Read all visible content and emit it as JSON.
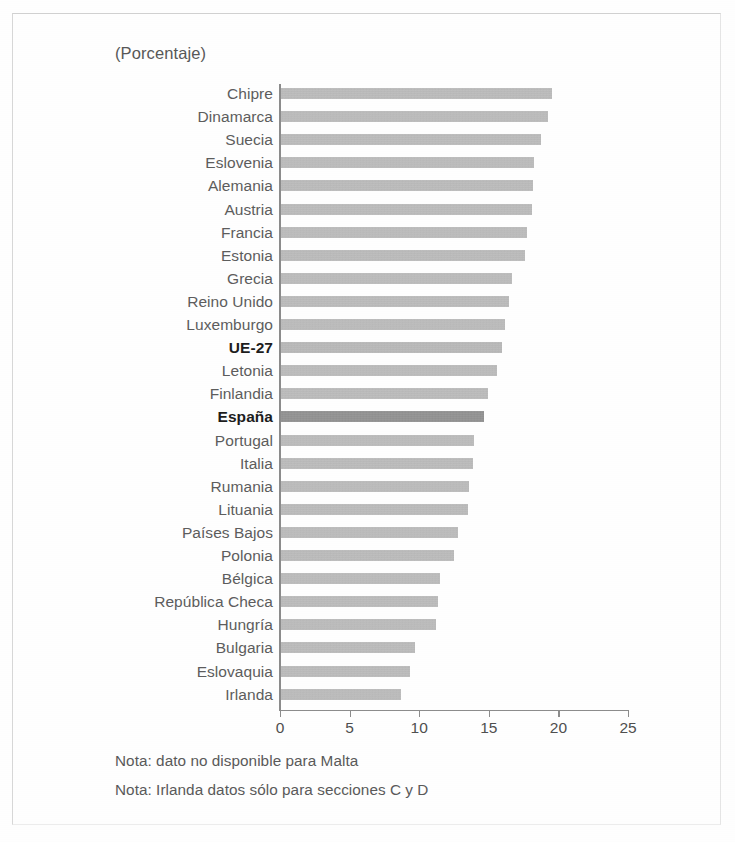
{
  "figure": {
    "unit_label": "(Porcentaje)",
    "notes": [
      "Nota: dato no disponible para Malta",
      "Nota: Irlanda datos sólo para secciones C y D"
    ]
  },
  "colors": {
    "bar": "#a8a8a8",
    "bar_highlight": "#6f6f6f",
    "axis": "#8c8c8c",
    "text": "#5d5d5d",
    "frame": "#d8d8d8"
  },
  "chart_data": {
    "type": "bar",
    "orientation": "horizontal",
    "title": "",
    "subtitle": "",
    "xlabel": "(Porcentaje)",
    "ylabel": "",
    "xlim": [
      0,
      25
    ],
    "xticks": [
      0,
      5,
      10,
      15,
      20,
      25
    ],
    "xtick_labels": [
      "0",
      "5",
      "10",
      "15",
      "20",
      "25"
    ],
    "grid": false,
    "legend": "none",
    "highlighted": [
      "UE-27",
      "España"
    ],
    "categories": [
      "Chipre",
      "Dinamarca",
      "Suecia",
      "Eslovenia",
      "Alemania",
      "Austria",
      "Francia",
      "Estonia",
      "Grecia",
      "Reino Unido",
      "Luxemburgo",
      "UE-27",
      "Letonia",
      "Finlandia",
      "España",
      "Portugal",
      "Italia",
      "Rumania",
      "Lituania",
      "Países Bajos",
      "Polonia",
      "Bélgica",
      "República Checa",
      "Hungría",
      "Bulgaria",
      "Eslovaquia",
      "Irlanda"
    ],
    "values": [
      19.5,
      19.2,
      18.7,
      18.2,
      18.1,
      18.0,
      17.7,
      17.5,
      16.6,
      16.4,
      16.1,
      15.9,
      15.5,
      14.9,
      14.6,
      13.9,
      13.8,
      13.5,
      13.4,
      12.7,
      12.4,
      11.4,
      11.3,
      11.1,
      9.6,
      9.3,
      8.6
    ],
    "annotations": [
      "Nota: dato no disponible para Malta",
      "Nota: Irlanda datos sólo para secciones C y D"
    ]
  }
}
